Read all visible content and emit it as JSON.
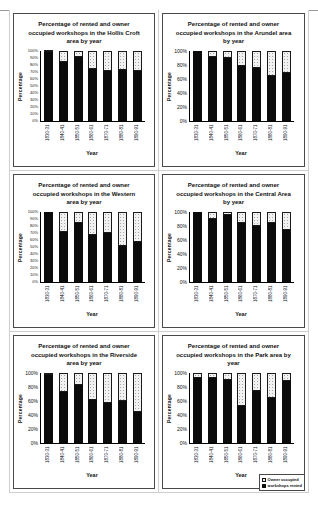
{
  "colors": {
    "rented": "#0b0b0b",
    "owner": "#f1f1f1",
    "axis": "#000000"
  },
  "legend": {
    "items": [
      {
        "label": "Owner occupied",
        "swatch": "owner"
      },
      {
        "label": "workshops rented",
        "swatch": "rented"
      }
    ]
  },
  "chart_data": [
    {
      "type": "bar",
      "stacked": true,
      "title": "Percentage of rented and owner occupied workshops in the Hollis Croft area by year",
      "xlabel": "Year",
      "ylabel": "Percentage",
      "ylim": [
        0,
        100
      ],
      "y_tick_step": 10,
      "categories": [
        "1830-31",
        "1840-41",
        "1850-51",
        "1860-61",
        "1870-71",
        "1880-81",
        "1890-91"
      ],
      "series": [
        {
          "name": "workshops rented",
          "color_key": "rented",
          "values": [
            98,
            85,
            92,
            74,
            72,
            73,
            72
          ]
        },
        {
          "name": "Owner occupied",
          "color_key": "owner",
          "values": [
            2,
            15,
            8,
            26,
            28,
            27,
            28
          ]
        }
      ]
    },
    {
      "type": "bar",
      "stacked": true,
      "title": "Percentage of rented and owner occupied workshops in the Arundel area by year",
      "xlabel": "Year",
      "ylabel": "Percentage",
      "ylim": [
        0,
        100
      ],
      "y_tick_step": 20,
      "categories": [
        "1830-31",
        "1840-41",
        "1850-51",
        "1860-61",
        "1870-71",
        "1880-81",
        "1890-91"
      ],
      "series": [
        {
          "name": "workshops rented",
          "color_key": "rented",
          "values": [
            100,
            92,
            90,
            78,
            76,
            65,
            68
          ]
        },
        {
          "name": "Owner occupied",
          "color_key": "owner",
          "values": [
            0,
            8,
            10,
            22,
            24,
            35,
            32
          ]
        }
      ]
    },
    {
      "type": "bar",
      "stacked": true,
      "title": "Percentage of rented and owner occupied workshops in the Western area by year",
      "xlabel": "Year",
      "ylabel": "Percentage",
      "ylim": [
        0,
        100
      ],
      "y_tick_step": 10,
      "categories": [
        "1830-31",
        "1840-41",
        "1850-51",
        "1860-61",
        "1870-71",
        "1880-81",
        "1890-91"
      ],
      "series": [
        {
          "name": "workshops rented",
          "color_key": "rented",
          "values": [
            100,
            72,
            85,
            67,
            70,
            52,
            57
          ]
        },
        {
          "name": "Owner occupied",
          "color_key": "owner",
          "values": [
            0,
            28,
            15,
            33,
            30,
            48,
            43
          ]
        }
      ]
    },
    {
      "type": "bar",
      "stacked": true,
      "title": "Percentage of rented and owner occupied workshops in the Central Area by year",
      "xlabel": "Year",
      "ylabel": "Percentage",
      "ylim": [
        0,
        100
      ],
      "y_tick_step": 20,
      "categories": [
        "1830-31",
        "1840-41",
        "1850-51",
        "1860-61",
        "1870-71",
        "1880-81",
        "1890-91"
      ],
      "series": [
        {
          "name": "workshops rented",
          "color_key": "rented",
          "values": [
            100,
            90,
            96,
            85,
            80,
            84,
            75
          ]
        },
        {
          "name": "Owner occupied",
          "color_key": "owner",
          "values": [
            0,
            10,
            4,
            15,
            20,
            16,
            25
          ]
        }
      ]
    },
    {
      "type": "bar",
      "stacked": true,
      "title": "Percentage of rented and owner occupied workshops in the Riverside area by year",
      "xlabel": "Year",
      "ylabel": "Percentage",
      "ylim": [
        0,
        100
      ],
      "y_tick_step": 20,
      "categories": [
        "1830-31",
        "1840-41",
        "1850-51",
        "1860-61",
        "1870-71",
        "1880-81",
        "1890-91"
      ],
      "series": [
        {
          "name": "workshops rented",
          "color_key": "rented",
          "values": [
            97,
            73,
            83,
            62,
            57,
            60,
            45
          ]
        },
        {
          "name": "Owner occupied",
          "color_key": "owner",
          "values": [
            3,
            27,
            17,
            38,
            43,
            40,
            55
          ]
        }
      ]
    },
    {
      "type": "bar",
      "stacked": true,
      "title": "Percentage of rented and owner occupied workshops in the Park area by year",
      "xlabel": "Year",
      "ylabel": "Percentage",
      "ylim": [
        0,
        100
      ],
      "y_tick_step": 20,
      "categories": [
        "1830-31",
        "1840-41",
        "1850-51",
        "1860-61",
        "1870-71",
        "1880-81",
        "1890-91"
      ],
      "series": [
        {
          "name": "workshops rented",
          "color_key": "rented",
          "values": [
            93,
            93,
            90,
            53,
            75,
            65,
            88
          ]
        },
        {
          "name": "Owner occupied",
          "color_key": "owner",
          "values": [
            7,
            7,
            10,
            47,
            25,
            35,
            12
          ]
        }
      ]
    }
  ]
}
